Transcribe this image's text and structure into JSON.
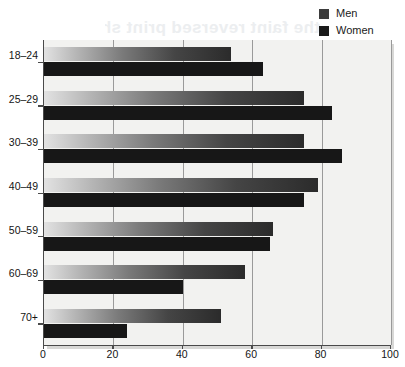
{
  "legend": {
    "position": "top-right",
    "entries": [
      {
        "label": "Men",
        "color": "#3c3c3c",
        "swatch_name": "legend-swatch-men"
      },
      {
        "label": "Women",
        "color": "#1a1a1a",
        "swatch_name": "legend-swatch-women"
      }
    ]
  },
  "background_artifact": {
    "text": "the faint reversed print showing through the page",
    "note": "scan bleed-through, illegible"
  },
  "colors": {
    "plot_background": "#f2f2f0",
    "axis": "#4a4a4a",
    "gridline": "#9a9a9a",
    "men_bar_start": "#e2e2e2",
    "men_bar_end": "#2b2b2b",
    "women_bar": "#171717",
    "text": "#141414"
  },
  "chart_data": {
    "type": "bar",
    "orientation": "horizontal",
    "title": "",
    "subtitle": "",
    "xlabel": "",
    "ylabel": "",
    "xlim": [
      0,
      100
    ],
    "xticks": [
      0,
      20,
      40,
      60,
      80,
      100
    ],
    "xticklabels": [
      "0",
      "20",
      "40",
      "60",
      "80",
      "100"
    ],
    "grid": true,
    "grid_axis": "x",
    "legend_position": "top-right",
    "categories": [
      "18–24",
      "25–29",
      "30–39",
      "40–49",
      "50–59",
      "60–69",
      "70+"
    ],
    "series": [
      {
        "name": "Men",
        "color": "#3c3c3c",
        "values": [
          54,
          75,
          75,
          79,
          66,
          58,
          51
        ]
      },
      {
        "name": "Women",
        "color": "#1a1a1a",
        "values": [
          63,
          83,
          86,
          75,
          65,
          40,
          24
        ]
      }
    ]
  }
}
